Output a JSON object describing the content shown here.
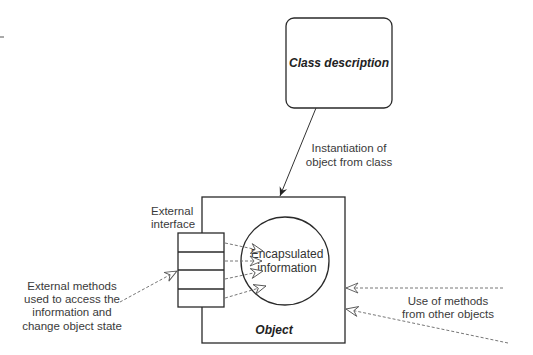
{
  "diagram": {
    "class_box": {
      "label": "Class description"
    },
    "instantiation": {
      "line1": "Instantiation of",
      "line2": "object from class"
    },
    "object_box": {
      "label": "Object"
    },
    "encapsulated": {
      "line1": "Encapsulated",
      "line2": "information"
    },
    "interface": {
      "line1": "External",
      "line2": "interface",
      "slots": 4
    },
    "external_methods": {
      "line1": "External methods",
      "line2": "used to access the",
      "line3": "information and",
      "line4": "change object state"
    },
    "other_objects": {
      "line1": "Use of methods",
      "line2": "from other objects"
    },
    "colors": {
      "line": "#2a2a2a",
      "text": "#3a3a3a",
      "dashed": "#666666"
    }
  }
}
